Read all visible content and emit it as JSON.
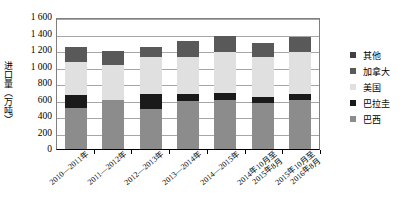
{
  "chart_data": {
    "type": "bar",
    "stacked": true,
    "title": "",
    "xlabel": "",
    "ylabel": "进口量（万吨）",
    "ylim": [
      0,
      1600
    ],
    "ytick_step": 200,
    "yticks": [
      "1 600",
      "1 400",
      "1 200",
      "1 000",
      "800",
      "600",
      "400",
      "200",
      "0"
    ],
    "grid": true,
    "legend_position": "right",
    "categories": [
      {
        "lines": [
          "2010—2011年"
        ]
      },
      {
        "lines": [
          "2011—2012年"
        ]
      },
      {
        "lines": [
          "2012—2013年"
        ]
      },
      {
        "lines": [
          "2013—2014年"
        ]
      },
      {
        "lines": [
          "2014—2015年"
        ]
      },
      {
        "lines": [
          "2014年10月至",
          "2015年8月"
        ]
      },
      {
        "lines": [
          "2015年10月至",
          "2016年8月"
        ]
      }
    ],
    "series": [
      {
        "name": "巴西",
        "color": "#8c8c8c",
        "values": [
          500,
          600,
          490,
          580,
          600,
          560,
          590
        ]
      },
      {
        "name": "巴拉圭",
        "color": "#1a1a1a",
        "values": [
          160,
          0,
          180,
          90,
          80,
          70,
          80
        ]
      },
      {
        "name": "美国",
        "color": "#e0e0e0",
        "values": [
          400,
          420,
          450,
          450,
          500,
          480,
          500
        ]
      },
      {
        "name": "加拿大",
        "color": "#595959",
        "values": [
          180,
          170,
          115,
          190,
          190,
          180,
          190
        ]
      },
      {
        "name": "其他",
        "color": "#404040",
        "values": [
          0,
          0,
          0,
          0,
          0,
          0,
          0
        ]
      }
    ],
    "totals": [
      1240,
      1190,
      1235,
      1310,
      1370,
      1290,
      1360
    ]
  },
  "legend": {
    "items": [
      {
        "label": "其他",
        "color": "#404040"
      },
      {
        "label": "加拿大",
        "color": "#595959"
      },
      {
        "label": "美国",
        "color": "#e0e0e0"
      },
      {
        "label": "巴拉圭",
        "color": "#1a1a1a"
      },
      {
        "label": "巴西",
        "color": "#8c8c8c"
      }
    ]
  }
}
